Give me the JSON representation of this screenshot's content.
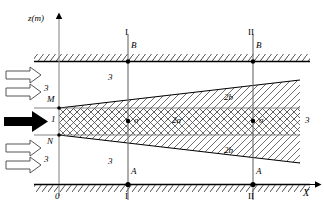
{
  "figure": {
    "type": "technical-cross-section-diagram",
    "axes": {
      "vertical_label": "z(m)",
      "horizontal_label": "X",
      "origin_label": "0"
    },
    "sections": [
      {
        "id": "I",
        "top_label": "I",
        "bottom_label": "I",
        "upper_point": "B",
        "lower_point": "A",
        "x": 128
      },
      {
        "id": "II",
        "top_label": "II",
        "bottom_label": "II",
        "upper_point": "B",
        "lower_point": "A",
        "x": 253
      }
    ],
    "boundary_points": {
      "upper_wedge_origin": "M",
      "lower_wedge_origin": "N"
    },
    "zone_labels": [
      {
        "name": "inflow-upper",
        "text": "3"
      },
      {
        "name": "inflow-lower",
        "text": "3"
      },
      {
        "name": "main-inflow",
        "text": "1"
      },
      {
        "name": "region-upper-outer",
        "text": "3"
      },
      {
        "name": "region-lower-outer",
        "text": "3"
      },
      {
        "name": "region-right-outer",
        "text": "3"
      },
      {
        "name": "core-thickness",
        "text": "2a"
      },
      {
        "name": "upper-transition-thickness",
        "text": "2b"
      },
      {
        "name": "lower-transition-thickness",
        "text": "2b"
      },
      {
        "name": "stress-symbol-section-1",
        "text": "σ"
      },
      {
        "name": "stress-symbol-section-2",
        "text": "σ"
      }
    ],
    "colors": {
      "line": "#000000",
      "hatch": "#555555",
      "background": "#ffffff",
      "arrow_fill": "#ffffff",
      "solid_arrow_fill": "#000000"
    }
  }
}
